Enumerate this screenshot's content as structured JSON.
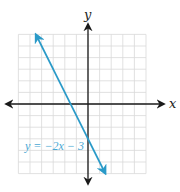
{
  "chart_data": {
    "type": "line",
    "title": "",
    "xlabel": "x",
    "ylabel": "y",
    "xlim": [
      -6,
      5
    ],
    "ylim": [
      -6,
      6
    ],
    "grid": true,
    "series": [
      {
        "name": "y = −2x − 3",
        "equation": "y = -2x - 3",
        "slope": -2,
        "intercept": -3,
        "x": [
          -4.5,
          1.5
        ],
        "values": [
          6,
          -6
        ],
        "arrows_both_ends": true,
        "color": "#2a9ac8"
      }
    ],
    "annotations": [
      {
        "text": "y = −2x − 3",
        "x": -5.8,
        "y": -3.9
      }
    ]
  },
  "labels": {
    "x_axis": "x",
    "y_axis": "y",
    "equation": "y = −2x − 3"
  },
  "colors": {
    "line": "#2a9ac8",
    "label": "#4aa8d4",
    "axis": "#1a1a1a",
    "grid": "#d9d9d9"
  }
}
